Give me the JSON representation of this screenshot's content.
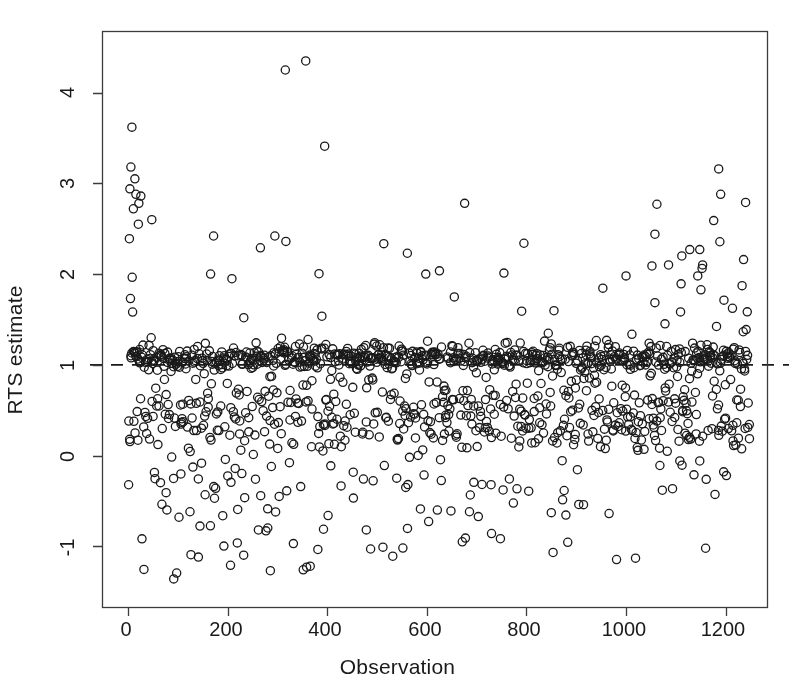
{
  "figure": {
    "width": 795,
    "height": 700,
    "background": "#ffffff",
    "foreground": "#1a1a1a"
  },
  "axes": {
    "x": {
      "label": "Observation",
      "ticks": [
        0,
        200,
        400,
        600,
        800,
        1000,
        1200
      ],
      "tick_labels": [
        "0",
        "200",
        "400",
        "600",
        "800",
        "1000",
        "1200"
      ],
      "lim": [
        -52,
        1283
      ]
    },
    "y": {
      "label": "RTS estimate",
      "ticks": [
        -1,
        0,
        1,
        2,
        3,
        4
      ],
      "tick_labels": [
        "-1",
        "0",
        "1",
        "2",
        "3",
        "4"
      ],
      "lim": [
        -1.67,
        4.68
      ]
    }
  },
  "plot_box": {
    "left": 102,
    "top": 31,
    "right": 767,
    "bottom": 607,
    "border_color": "#3c3c3c",
    "border_width": 1.3
  },
  "reference_line": {
    "y": 1,
    "style": "dashed",
    "color": "#1a1a1a",
    "width": 1.8,
    "extends_past_right_border": true
  },
  "marker": {
    "shape": "open-circle",
    "radius": 4.1,
    "stroke": "#1a1a1a",
    "stroke_width": 1.3,
    "fill": "none"
  },
  "chart_data": {
    "type": "scatter",
    "title": "",
    "xlabel": "Observation",
    "ylabel": "RTS estimate",
    "xlim": [
      -52,
      1283
    ],
    "ylim": [
      -1.67,
      4.68
    ],
    "grid": false,
    "legend": null,
    "n_points": 1248,
    "annotations": [
      {
        "text": "dashed horizontal reference line",
        "y": 1
      }
    ],
    "series": [
      {
        "name": "RTS estimate",
        "marker": "open-circle",
        "color": "#1a1a1a",
        "description": "Per-observation returns-to-scale estimates. A very dense band sits just above 1.0 (the dominant mode, roughly 1.02-1.15), a broad secondary cloud spans about 0.15-0.85, and a sparse lower tail reaches down near -1.35, thinning out after observation ~600. A handful of high outliers rise to 2-3 near the left edge and again after observation ~1050, with two extreme points near 4.25-4.35 around observations 320-360 and one near 3.4 at observation ~395.",
        "generator": {
          "method": "seeded-mixture",
          "seed": 20240517,
          "x_range": [
            1,
            1248
          ],
          "components": [
            {
              "name": "core-band",
              "weight": 0.46,
              "y_center": 1.08,
              "y_spread": 0.075,
              "note": "dense near-constant returns band just above unity"
            },
            {
              "name": "mid-cloud",
              "weight": 0.3,
              "y_center": 0.46,
              "y_spread": 0.24,
              "note": "broad secondary cluster between 0.1 and 0.9"
            },
            {
              "name": "low-tail",
              "weight": 0.16,
              "y_center": -0.45,
              "y_spread": 0.42,
              "x_decay": 0.55,
              "note": "sparse negative tail, density falls off to the right"
            },
            {
              "name": "upper-scatter",
              "weight": 0.08,
              "y_center": 1.75,
              "y_spread": 0.45,
              "note": "upper scatter 1.4-3.2, concentrated at left and right edges"
            }
          ],
          "fixed_outliers": [
            {
              "x": 8,
              "y": 3.62
            },
            {
              "x": 6,
              "y": 3.18
            },
            {
              "x": 14,
              "y": 3.05
            },
            {
              "x": 4,
              "y": 2.94
            },
            {
              "x": 16,
              "y": 2.88
            },
            {
              "x": 26,
              "y": 2.86
            },
            {
              "x": 22,
              "y": 2.78
            },
            {
              "x": 11,
              "y": 2.72
            },
            {
              "x": 48,
              "y": 2.6
            },
            {
              "x": 21,
              "y": 2.55
            },
            {
              "x": 3,
              "y": 2.39
            },
            {
              "x": 172,
              "y": 2.42
            },
            {
              "x": 266,
              "y": 2.29
            },
            {
              "x": 295,
              "y": 2.42
            },
            {
              "x": 316,
              "y": 4.25
            },
            {
              "x": 357,
              "y": 4.35
            },
            {
              "x": 395,
              "y": 3.41
            },
            {
              "x": 561,
              "y": 2.23
            },
            {
              "x": 598,
              "y": 2.0
            },
            {
              "x": 676,
              "y": 2.78
            },
            {
              "x": 795,
              "y": 2.34
            },
            {
              "x": 1062,
              "y": 2.77
            },
            {
              "x": 1186,
              "y": 3.16
            },
            {
              "x": 1190,
              "y": 2.88
            },
            {
              "x": 1240,
              "y": 2.79
            },
            {
              "x": 1176,
              "y": 2.59
            },
            {
              "x": 1058,
              "y": 2.44
            },
            {
              "x": 1128,
              "y": 2.27
            },
            {
              "x": 1148,
              "y": 2.27
            },
            {
              "x": 1236,
              "y": 2.16
            },
            {
              "x": 1112,
              "y": 2.2
            },
            {
              "x": 1052,
              "y": 2.09
            },
            {
              "x": 1000,
              "y": 1.98
            },
            {
              "x": 1144,
              "y": 1.98
            },
            {
              "x": 92,
              "y": -1.36
            },
            {
              "x": 206,
              "y": -1.21
            },
            {
              "x": 286,
              "y": -1.27
            },
            {
              "x": 352,
              "y": -1.26
            },
            {
              "x": 366,
              "y": -1.22
            },
            {
              "x": 552,
              "y": -1.02
            },
            {
              "x": 512,
              "y": -1.01
            },
            {
              "x": 730,
              "y": -0.86
            },
            {
              "x": 850,
              "y": -0.63
            },
            {
              "x": 966,
              "y": -0.64
            },
            {
              "x": 1196,
              "y": -0.18
            },
            {
              "x": 1108,
              "y": -0.06
            },
            {
              "x": 1148,
              "y": -0.06
            },
            {
              "x": 1068,
              "y": -0.11
            },
            {
              "x": 1216,
              "y": 0.11
            }
          ]
        }
      }
    ]
  }
}
